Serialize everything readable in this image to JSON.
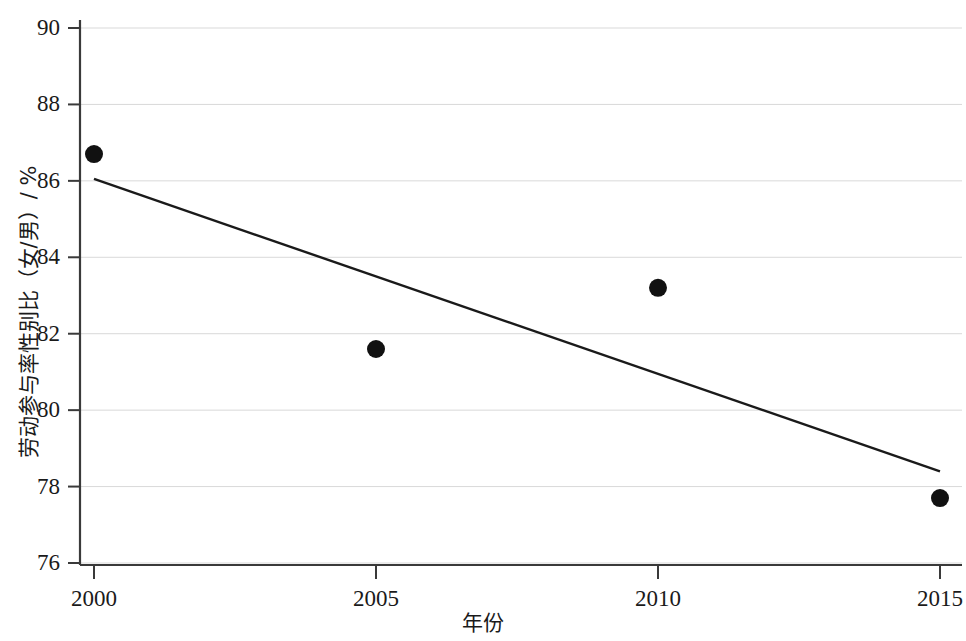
{
  "chart_data": {
    "type": "scatter",
    "title": "",
    "xlabel": "年份",
    "ylabel": "劳动参与率性别比（女/男）/ %",
    "x": [
      2000,
      2005,
      2010,
      2015
    ],
    "values": [
      86.7,
      81.6,
      83.2,
      77.7
    ],
    "series": [
      {
        "name": "劳动参与率性别比（女/男）",
        "type": "scatter",
        "x": [
          2000,
          2005,
          2010,
          2015
        ],
        "values": [
          86.7,
          81.6,
          83.2,
          77.7
        ],
        "marker": "filled-circle",
        "color": "#111111"
      },
      {
        "name": "趋势线",
        "type": "line",
        "x": [
          2000,
          2015
        ],
        "values": [
          86.05,
          78.4
        ],
        "color": "#1a1a1a"
      }
    ],
    "xlim": [
      2000,
      2015
    ],
    "ylim": [
      76,
      90
    ],
    "xticks": [
      2000,
      2005,
      2010,
      2015
    ],
    "xtick_labels": [
      "2000",
      "2005",
      "2010",
      "2015"
    ],
    "yticks": [
      76,
      78,
      80,
      82,
      84,
      86,
      88,
      90
    ],
    "ytick_labels": [
      "76",
      "78",
      "80",
      "82",
      "84",
      "86",
      "88",
      "90"
    ],
    "grid": "horizontal",
    "grid_color": "#d9d9d9",
    "axis_color": "#3a3a3a",
    "legend": "none",
    "background": "#ffffff"
  }
}
